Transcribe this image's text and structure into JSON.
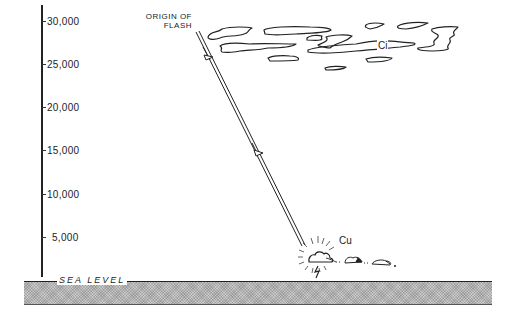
{
  "diagram": {
    "axis": {
      "ticks": [
        {
          "label": "30,000",
          "y": 21
        },
        {
          "label": "25,000",
          "y": 64
        },
        {
          "label": "20,000",
          "y": 107
        },
        {
          "label": "15,000",
          "y": 150
        },
        {
          "label": "10,000",
          "y": 194
        },
        {
          "label": "5,000",
          "y": 237
        }
      ]
    },
    "labels": {
      "origin": "ORIGIN OF FLASH",
      "origin_line1": "ORIGIN OF",
      "origin_line2": "FLASH",
      "sea_level": "SEA LEVEL",
      "cirrus": "Ci",
      "cumulus": "Cu"
    },
    "colors": {
      "ink": "#222222",
      "ground": "#c9c9c9",
      "background": "#ffffff"
    }
  }
}
